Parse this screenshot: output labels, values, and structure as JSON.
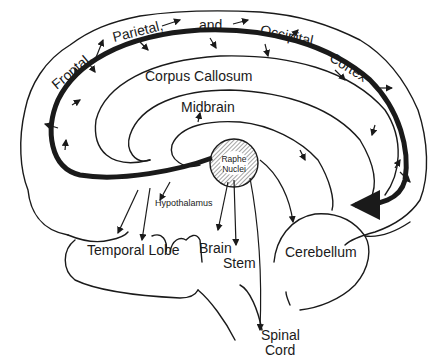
{
  "diagram": {
    "labels": {
      "frontal": "Frontal,",
      "parietal": "Parietal,",
      "and": "and",
      "occipital": "Occipital",
      "cortex": "Cortex",
      "corpus_callosum": "Corpus Callosum",
      "midbrain": "Midbrain",
      "raphe_line1": "Raphe",
      "raphe_line2": "Nuclei",
      "hypothalamus": "Hypothalamus",
      "temporal_lobe": "Temporal Lobe",
      "brain": "Brain",
      "stem": "Stem",
      "cerebellum": "Cerebellum",
      "spinal": "Spinal",
      "cord": "Cord"
    },
    "colors": {
      "ink": "#1a1a1a",
      "background": "#ffffff"
    }
  }
}
